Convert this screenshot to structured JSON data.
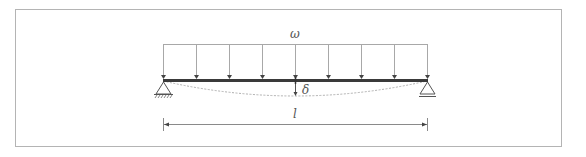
{
  "diagram": {
    "labels": {
      "load": "ω",
      "deflection": "δ",
      "length": "l"
    },
    "colors": {
      "frame": "#b4b4b4",
      "beam": "#3a3a3a",
      "load_lines": "#a8a8a8",
      "arrow_heads": "#444444",
      "deflected_shape": "#b0b0b0",
      "dimension_line": "#8a8a8a",
      "support": "#555555",
      "text": "#555555"
    },
    "geometry": {
      "frame": {
        "x": 15,
        "y": 9,
        "width": 547,
        "height": 138
      },
      "beam": {
        "x1": 163,
        "x2": 427,
        "y": 80
      },
      "load_top_y": 44,
      "arrow_x": [
        163,
        196,
        229,
        262,
        295,
        328,
        361,
        394,
        427
      ],
      "midspan_deflection_y": 96,
      "dimension_y": 124
    },
    "supports": {
      "left": "pin-support",
      "right": "roller-support"
    }
  }
}
